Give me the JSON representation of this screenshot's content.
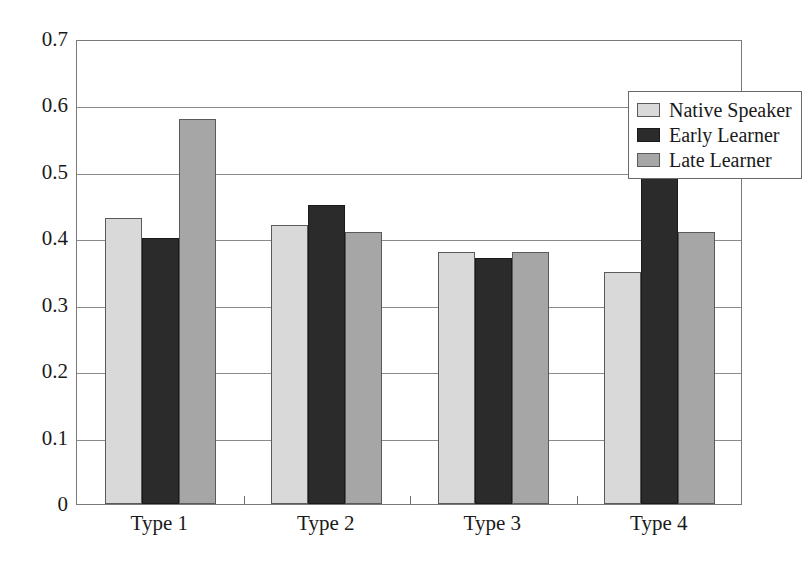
{
  "chart_data": {
    "type": "bar",
    "title": "",
    "subtitle": "",
    "xlabel": "",
    "ylabel": "",
    "categories": [
      "Type 1",
      "Type 2",
      "Type 3",
      "Type 4"
    ],
    "series": [
      {
        "name": "Native Speaker",
        "color": "#d9d9d9",
        "values": [
          0.43,
          0.42,
          0.38,
          0.35
        ]
      },
      {
        "name": "Early Learner",
        "color": "#2b2b2b",
        "values": [
          0.4,
          0.45,
          0.37,
          0.51
        ]
      },
      {
        "name": "Late Learner",
        "color": "#a6a6a6",
        "values": [
          0.58,
          0.41,
          0.38,
          0.41
        ]
      }
    ],
    "ylim": [
      0,
      0.7
    ],
    "ytick_labels": [
      "0.7",
      "0.6",
      "0.5",
      "0.4",
      "0.3",
      "0.2",
      "0.1",
      "0"
    ],
    "ytick_values": [
      0.7,
      0.6,
      0.5,
      0.4,
      0.3,
      0.2,
      0.1,
      0
    ],
    "grid": true,
    "grid_axis": "y",
    "legend_position": "top-right-inside",
    "legend_entries": [
      "Native Speaker",
      "Early Learner",
      "Late Learner"
    ],
    "annotations": [],
    "bar_border_color": "#3a3a3a",
    "axis_color": "#7a7a7a",
    "background_color": "#ffffff"
  }
}
